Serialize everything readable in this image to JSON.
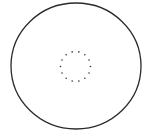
{
  "diagram": {
    "background": "#ffffff",
    "outer_circle": {
      "cx": 76,
      "cy": 66,
      "rx": 65,
      "ry": 63,
      "stroke": "#2a2a2a",
      "stroke_width": 1.3
    },
    "inner_dotted_ring": {
      "cx": 75.5,
      "cy": 66.5,
      "r": 15,
      "dot_count": 14,
      "dot_radius": 0.8,
      "color": "#333333"
    }
  }
}
